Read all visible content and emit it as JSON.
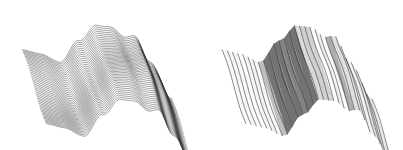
{
  "figure": {
    "background": "#ffffff",
    "panels": [
      {
        "id": "left",
        "description": "3D wavy surface rendered with dense lines along the ridge-crossing direction",
        "line_direction": "u",
        "line_count": 46,
        "samples": 80,
        "origin": [
          22,
          52
        ],
        "U": [
          150,
          30
        ],
        "V": [
          24,
          74
        ],
        "height_scale": 46,
        "stroke": "#3a3a3a",
        "stroke_width": 0.55,
        "shading": false
      },
      {
        "id": "right",
        "description": "Same 3D wavy surface rendered with sparse lines along the ridge direction, gray-shaded strips",
        "line_direction": "v",
        "line_count": 30,
        "samples": 40,
        "origin": [
          22,
          52
        ],
        "U": [
          150,
          30
        ],
        "V": [
          24,
          74
        ],
        "height_scale": 46,
        "stroke": "#333333",
        "stroke_width": 0.7,
        "shading": true
      }
    ],
    "surface_profile": {
      "comment": "height as function of u in [0,1]; two ridges",
      "points_u": [
        0.0,
        0.12,
        0.25,
        0.38,
        0.5,
        0.6,
        0.68,
        0.75,
        0.85,
        1.0
      ],
      "points_z": [
        0.05,
        0.0,
        -0.12,
        0.45,
        0.9,
        0.95,
        0.82,
        0.9,
        0.4,
        -0.35
      ]
    }
  }
}
